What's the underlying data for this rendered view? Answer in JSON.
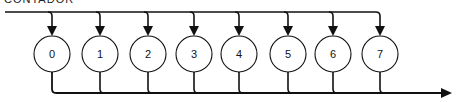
{
  "caption": "CONTADOR",
  "nodes": [
    {
      "label": "0",
      "cx": 52
    },
    {
      "label": "1",
      "cx": 100
    },
    {
      "label": "2",
      "cx": 148
    },
    {
      "label": "3",
      "cx": 194
    },
    {
      "label": "4",
      "cx": 239
    },
    {
      "label": "5",
      "cx": 288
    },
    {
      "label": "6",
      "cx": 333
    },
    {
      "label": "7",
      "cx": 380
    }
  ],
  "geometry": {
    "top_bus_y": 12,
    "bottom_bus_y": 93,
    "circle_cy": 54,
    "circle_r": 18,
    "top_bus_start_x": 5,
    "bottom_bus_end_x": 452
  },
  "colors": {
    "stroke": "#111111",
    "fill": "#ffffff"
  }
}
